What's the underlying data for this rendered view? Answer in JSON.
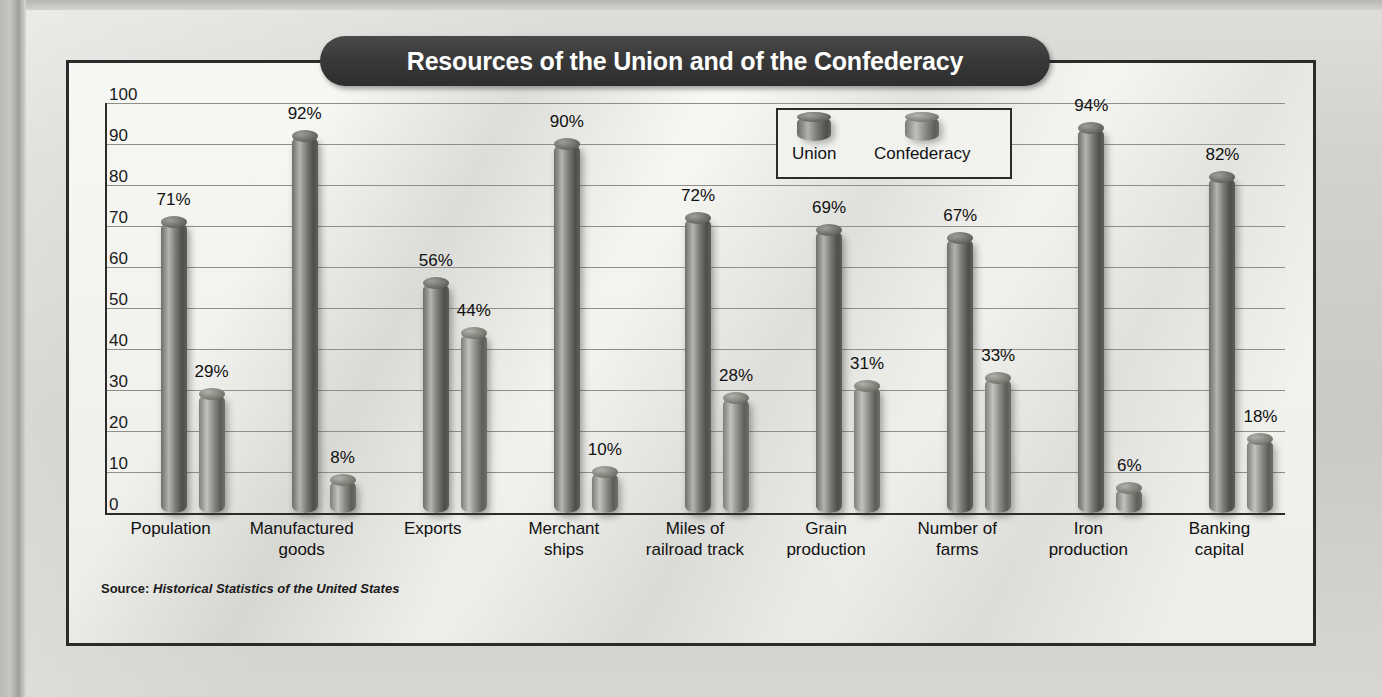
{
  "chart_data": {
    "type": "bar",
    "title": "Resources of the Union and of the Confederacy",
    "xlabel": "",
    "ylabel": "",
    "ylim": [
      0,
      100
    ],
    "ytick_labels": [
      "100",
      "90",
      "80",
      "70",
      "60",
      "50",
      "40",
      "30",
      "20",
      "10",
      "0"
    ],
    "grid": true,
    "legend_position": "top-center-inside",
    "value_suffix": "%",
    "categories": [
      "Population",
      "Manufactured goods",
      "Exports",
      "Merchant ships",
      "Miles of railroad track",
      "Grain production",
      "Number of farms",
      "Iron production",
      "Banking capital"
    ],
    "category_lines": [
      [
        "Population"
      ],
      [
        "Manufactured",
        "goods"
      ],
      [
        "Exports"
      ],
      [
        "Merchant",
        "ships"
      ],
      [
        "Miles of",
        "railroad track"
      ],
      [
        "Grain",
        "production"
      ],
      [
        "Number of",
        "farms"
      ],
      [
        "Iron",
        "production"
      ],
      [
        "Banking",
        "capital"
      ]
    ],
    "series": [
      {
        "name": "Union",
        "values": [
          71,
          92,
          56,
          90,
          72,
          69,
          67,
          94,
          82
        ],
        "labels": [
          "71%",
          "92%",
          "56%",
          "90%",
          "72%",
          "69%",
          "67%",
          "94%",
          "82%"
        ]
      },
      {
        "name": "Confederacy",
        "values": [
          29,
          8,
          44,
          10,
          28,
          31,
          33,
          6,
          18
        ],
        "labels": [
          "29%",
          "8%",
          "44%",
          "10%",
          "28%",
          "31%",
          "33%",
          "6%",
          "18%"
        ]
      }
    ]
  },
  "legend": {
    "items": [
      {
        "label": "Union",
        "swatch": "cylinder-dark"
      },
      {
        "label": "Confederacy",
        "swatch": "cylinder-light"
      }
    ]
  },
  "source": {
    "label": "Source:",
    "value": "Historical Statistics of the United States"
  },
  "colors": {
    "page_background": "#cfcfcb",
    "panel_background": "#f4f4f1",
    "panel_border": "#2b2b2b",
    "title_pill": "#3a3a3a",
    "title_text": "#ffffff",
    "union_bar": "#6e6e6a",
    "confederacy_bar": "#8c8c88",
    "gridline": "#8f8f8a",
    "axis": "#2b2b2b",
    "text": "#111111"
  }
}
